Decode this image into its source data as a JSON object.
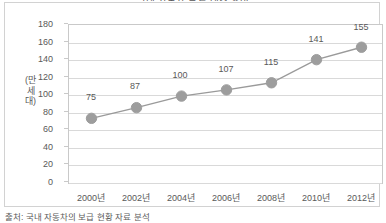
{
  "chart_data": {
    "type": "line",
    "title": "국내 자동차 등록 대수 추이",
    "categories": [
      "2000년",
      "2002년",
      "2004년",
      "2006년",
      "2008년",
      "2010년",
      "2012년"
    ],
    "values": [
      75,
      87,
      100,
      107,
      115,
      141,
      155
    ],
    "point_labels": [
      "75",
      "87",
      "100",
      "107",
      "115",
      "141",
      "155"
    ],
    "xlabel": "",
    "ylabel": "(만 세 대)",
    "ylabel_chars": [
      "(만",
      "세",
      "대)"
    ],
    "ylim": [
      0,
      180
    ],
    "yticks": [
      "180",
      "160",
      "140",
      "120",
      "100",
      "80",
      "60",
      "40",
      "20",
      "0"
    ],
    "ytick_values": [
      180,
      160,
      140,
      120,
      100,
      80,
      60,
      40,
      20,
      0
    ],
    "grid": true,
    "legend": "none",
    "series_color": "#9a9a9a",
    "marker_color": "#9d9d9d",
    "grid_color": "#d9d9d9",
    "axis_color": "#c9c9c9",
    "text_color": "#595959"
  },
  "figure": {
    "source_note": "출처: 국내 자동차의 보급 현황 자료 분석",
    "frame_color": "#d2d2d2"
  }
}
